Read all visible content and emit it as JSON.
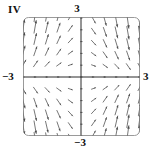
{
  "figure": {
    "tag": "IV",
    "caption": ""
  },
  "labels": {
    "top": "3",
    "bottom": "−3",
    "left": "−3",
    "right": "3"
  },
  "colors": {
    "background": "#ffffff",
    "frame": "#8a8a8a",
    "axis": "#2b2b2b",
    "arrow": "#4a4a4a",
    "text": "#111111"
  },
  "chart_data": {
    "type": "scatter",
    "subtype": "direction-field",
    "title": "",
    "xlabel": "",
    "ylabel": "",
    "xlim": [
      -3,
      3
    ],
    "ylim": [
      -3,
      3
    ],
    "xticks": [
      -3,
      3
    ],
    "yticks": [
      -3,
      3
    ],
    "xtick_labels": [
      "−3",
      "3"
    ],
    "ytick_labels": [
      "−3",
      "3"
    ],
    "grid": false,
    "legend": null,
    "axes_drawn_at_origin": true,
    "frame": "rounded-rectangle",
    "samples_per_axis": 11,
    "sample_coords": [
      -3.0,
      -2.4,
      -1.8,
      -1.2,
      -0.6,
      0.0,
      0.6,
      1.2,
      1.8,
      2.4,
      3.0
    ],
    "field_formula": "u = 1, v = -x*y  (normalized, length scales with magnitude)",
    "quadrant_directions": [
      {
        "quadrant": "upper-left",
        "x_range": [
          -3,
          0
        ],
        "y_range": [
          0,
          3
        ],
        "direction": "northeast",
        "angle_deg": 40
      },
      {
        "quadrant": "upper-right",
        "x_range": [
          0,
          3
        ],
        "y_range": [
          0,
          3
        ],
        "direction": "southeast",
        "angle_deg": -40
      },
      {
        "quadrant": "lower-left",
        "x_range": [
          -3,
          0
        ],
        "y_range": [
          -3,
          0
        ],
        "direction": "northwest",
        "angle_deg": 140
      },
      {
        "quadrant": "lower-right",
        "x_range": [
          0,
          3
        ],
        "y_range": [
          -3,
          0
        ],
        "direction": "northeast",
        "angle_deg": 40
      }
    ]
  }
}
